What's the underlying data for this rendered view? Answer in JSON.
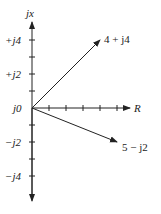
{
  "diagram": {
    "type": "complex-plane-phasor",
    "axes": {
      "vertical_label": "jx",
      "horizontal_label": "R",
      "origin_label": "j0",
      "vertical_ticks": [
        {
          "value": 4,
          "label": "+j4"
        },
        {
          "value": 3,
          "label": ""
        },
        {
          "value": 2,
          "label": "+j2"
        },
        {
          "value": 1,
          "label": ""
        },
        {
          "value": -1,
          "label": ""
        },
        {
          "value": -2,
          "label": "−j2"
        },
        {
          "value": -3,
          "label": ""
        },
        {
          "value": -4,
          "label": "−j4"
        }
      ],
      "horizontal_ticks": [
        1,
        2,
        3,
        4,
        5
      ]
    },
    "vectors": [
      {
        "label": "4 + j4",
        "real": 4,
        "imag": 4
      },
      {
        "label": "5 − j2",
        "real": 5,
        "imag": -2
      }
    ],
    "colors": {
      "ink": "#222222",
      "background": "#ffffff"
    }
  }
}
